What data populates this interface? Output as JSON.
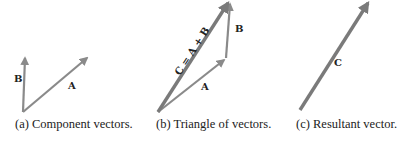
{
  "figure": {
    "colors": {
      "vector": "#8a8a8a",
      "vector_resultant": "#7a7a7a",
      "text": "#222222",
      "background": "#ffffff"
    },
    "panels": [
      {
        "id": "a",
        "caption": "(a)  Component vectors.",
        "vectors": [
          {
            "label": "B",
            "from": [
              23,
              112
            ],
            "to": [
              25,
              56
            ]
          },
          {
            "label": "A",
            "from": [
              23,
              112
            ],
            "to": [
              89,
              57
            ]
          }
        ]
      },
      {
        "id": "b",
        "caption": "(b)  Triangle of vectors.",
        "vectors": [
          {
            "label": "A",
            "from": [
              158,
              112
            ],
            "to": [
              226,
              58
            ]
          },
          {
            "label": "B",
            "from": [
              226,
              58
            ],
            "to": [
              230,
              1
            ]
          },
          {
            "label": "C = A + B",
            "from": [
              158,
              112
            ],
            "to": [
              230,
              1
            ]
          }
        ]
      },
      {
        "id": "c",
        "caption": "(c)  Resultant vector.",
        "vectors": [
          {
            "label": "C",
            "from": [
              300,
              110
            ],
            "to": [
              370,
              0
            ]
          }
        ]
      }
    ]
  }
}
